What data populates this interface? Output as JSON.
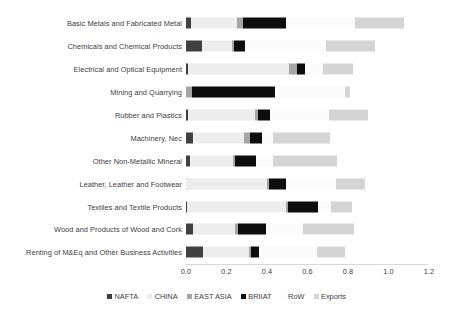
{
  "chart_data": {
    "type": "bar",
    "orientation": "horizontal",
    "stacked": true,
    "title": "",
    "xlabel": "",
    "ylabel": "",
    "xlim": [
      0.0,
      1.2
    ],
    "xticks": [
      "0.0",
      "0.2",
      "0.4",
      "0.6",
      "0.8",
      "1.0",
      "1.2"
    ],
    "xtick_values": [
      0.0,
      0.2,
      0.4,
      0.6,
      0.8,
      1.0,
      1.2
    ],
    "grid": false,
    "legend_position": "bottom",
    "categories": [
      "Basic Metals and Fabricated Metal",
      "Chemicals and Chemical Products",
      "Electrical and Optical Equipment",
      "Mining and Quarrying",
      "Rubber and Plastics",
      "Machinery, Nec",
      "Other Non-Metallic Mineral",
      "Leather, Leather and Footwear",
      "Textiles and Textile Products",
      "Wood and Products of Wood and Cork",
      "Renting of M&Eq and Other Business Activities"
    ],
    "series": [
      {
        "name": "NAFTA",
        "color": "#404040",
        "values": [
          0.025,
          0.08,
          0.01,
          0.0,
          0.01,
          0.035,
          0.018,
          0.002,
          0.004,
          0.033,
          0.082
        ]
      },
      {
        "name": "CHINA",
        "color": "#ededed",
        "values": [
          0.225,
          0.145,
          0.5,
          0.0,
          0.33,
          0.25,
          0.215,
          0.4,
          0.49,
          0.21,
          0.23
        ]
      },
      {
        "name": "EAST ASIA",
        "color": "#a6a6a6",
        "values": [
          0.03,
          0.012,
          0.038,
          0.03,
          0.015,
          0.03,
          0.008,
          0.008,
          0.008,
          0.015,
          0.007
        ]
      },
      {
        "name": "BRIIAT",
        "color": "#0d0d0d",
        "values": [
          0.215,
          0.052,
          0.038,
          0.41,
          0.06,
          0.06,
          0.105,
          0.085,
          0.15,
          0.135,
          0.042
        ]
      },
      {
        "name": "RoW",
        "color": "#fbfbfb",
        "values": [
          0.34,
          0.4,
          0.09,
          0.345,
          0.29,
          0.055,
          0.085,
          0.245,
          0.065,
          0.185,
          0.285
        ]
      },
      {
        "name": "Exports",
        "color": "#d4d4d4",
        "values": [
          0.24,
          0.245,
          0.15,
          0.025,
          0.195,
          0.28,
          0.315,
          0.145,
          0.105,
          0.25,
          0.14
        ]
      }
    ]
  },
  "legend": {
    "items": [
      {
        "label": "NAFTA",
        "color": "#404040"
      },
      {
        "label": "CHINA",
        "color": "#ededed"
      },
      {
        "label": "EAST ASIA",
        "color": "#a6a6a6"
      },
      {
        "label": "BRIIAT",
        "color": "#0d0d0d"
      },
      {
        "label": "RoW",
        "color": "#fdfdfd"
      },
      {
        "label": "Exports",
        "color": "#d4d4d4"
      }
    ]
  }
}
